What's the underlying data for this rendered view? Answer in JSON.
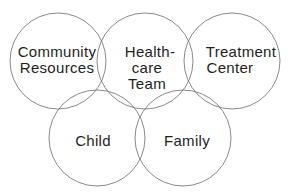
{
  "diagram": {
    "type": "overlapping-circles",
    "stroke_color": "#6b6b6b",
    "text_color": "#1e1e1e",
    "circles": [
      {
        "id": "community-resources",
        "lines": [
          "Community",
          "Resources"
        ],
        "cx": 58,
        "cy": 61,
        "r": 48
      },
      {
        "id": "health-care-team",
        "lines": [
          "Health-",
          "care",
          "Team"
        ],
        "cx": 145,
        "cy": 61,
        "r": 48
      },
      {
        "id": "treatment-center",
        "lines": [
          "Treatment",
          "Center"
        ],
        "cx": 232,
        "cy": 61,
        "r": 48
      },
      {
        "id": "child",
        "lines": [
          "Child"
        ],
        "cx": 97,
        "cy": 138,
        "r": 48
      },
      {
        "id": "family",
        "lines": [
          "Family"
        ],
        "cx": 183,
        "cy": 138,
        "r": 48
      }
    ]
  }
}
